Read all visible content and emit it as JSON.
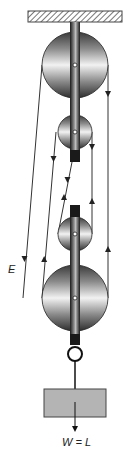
{
  "diagram": {
    "labels": {
      "effort": "E",
      "weight": "W = L"
    },
    "colors": {
      "rope": "#333333",
      "strap": "#2a2a2a",
      "load_fill": "#b4b4b4",
      "load_stroke": "#444444",
      "ceiling_hatch": "#555555"
    },
    "components": {
      "ceiling": "fixed support (hatched)",
      "pulleys": [
        {
          "name": "top-fixed-large-pulley",
          "size": "large"
        },
        {
          "name": "top-fixed-small-pulley",
          "size": "small"
        },
        {
          "name": "bottom-moving-small-pulley",
          "size": "small"
        },
        {
          "name": "bottom-moving-large-pulley",
          "size": "large"
        }
      ],
      "hook": "ring",
      "load": "weight block"
    }
  }
}
